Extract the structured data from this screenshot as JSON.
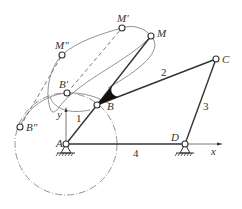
{
  "diagram": {
    "type": "four-bar linkage with coupler curve",
    "points": {
      "A": "A",
      "B": "B",
      "C": "C",
      "D": "D",
      "M": "M",
      "M_prime": "M′",
      "M_double_prime": "M″",
      "B_prime": "B′",
      "B_double_prime": "B″"
    },
    "links": {
      "crank": "1",
      "coupler": "2",
      "rocker": "3",
      "frame": "4"
    },
    "axes": {
      "x": "x",
      "y": "y"
    },
    "colors": {
      "line": "#333333",
      "curve": "#777777",
      "background": "#ffffff"
    }
  }
}
